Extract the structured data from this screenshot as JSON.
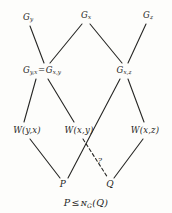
{
  "figure": {
    "kind": "subgroup-lattice-diagram",
    "caption": {
      "left": "P",
      "relation": "≤",
      "operator": "ɴ",
      "operator_subscript": "G",
      "argument": "(Q)",
      "full": "P ≤ 𝒩G(Q)"
    },
    "uncertain_marker": "?"
  },
  "nodes": {
    "top": [
      {
        "id": "G_y",
        "base": "G",
        "sub": "y",
        "x": 28,
        "y": 18
      },
      {
        "id": "G_x",
        "base": "G",
        "sub": "x",
        "x": 86,
        "y": 16
      },
      {
        "id": "G_z",
        "base": "G",
        "sub": "z",
        "x": 148,
        "y": 16
      }
    ],
    "middle": [
      {
        "id": "G_yx_eq_G_xy",
        "left_base": "G",
        "left_sub": "y,x",
        "equals": "=",
        "right_base": "G",
        "right_sub": "x,y",
        "x": 42,
        "y": 71
      },
      {
        "id": "G_xz",
        "base": "G",
        "sub": "x,z",
        "x": 124,
        "y": 71
      }
    ],
    "w_level": [
      {
        "id": "W_yx",
        "base": "W",
        "args": "(y,x)",
        "x": 27,
        "y": 130
      },
      {
        "id": "W_xy",
        "base": "W",
        "args": "(x,y)",
        "x": 79,
        "y": 130
      },
      {
        "id": "W_xz",
        "base": "W",
        "args": "(x,z)",
        "x": 145,
        "y": 130
      }
    ],
    "bottom": [
      {
        "id": "P",
        "label": "P",
        "x": 63,
        "y": 184
      },
      {
        "id": "Q",
        "label": "Q",
        "x": 110,
        "y": 184
      }
    ]
  },
  "marker": {
    "text": "?",
    "x": 100,
    "y": 160
  },
  "edges": [
    {
      "from": "G_y",
      "to": "G_yx_eq_G_xy",
      "style": "solid",
      "x1": 30,
      "y1": 26,
      "x2": 44,
      "y2": 63
    },
    {
      "from": "G_x",
      "to": "G_yx_eq_G_xy",
      "style": "solid",
      "x1": 82,
      "y1": 24,
      "x2": 50,
      "y2": 63
    },
    {
      "from": "G_x",
      "to": "G_xz",
      "style": "solid",
      "x1": 90,
      "y1": 24,
      "x2": 122,
      "y2": 63
    },
    {
      "from": "G_z",
      "to": "G_xz",
      "style": "solid",
      "x1": 146,
      "y1": 24,
      "x2": 128,
      "y2": 63
    },
    {
      "from": "G_yx_eq_G_xy",
      "to": "W_yx",
      "style": "solid",
      "x1": 36,
      "y1": 79,
      "x2": 24,
      "y2": 122
    },
    {
      "from": "G_yx_eq_G_xy",
      "to": "W_xy",
      "style": "solid",
      "x1": 48,
      "y1": 79,
      "x2": 74,
      "y2": 122
    },
    {
      "from": "G_xz",
      "to": "P_crossing",
      "style": "solid",
      "x1": 120,
      "y1": 79,
      "x2": 68,
      "y2": 178
    },
    {
      "from": "G_xz",
      "to": "W_xz",
      "style": "solid",
      "x1": 128,
      "y1": 79,
      "x2": 144,
      "y2": 122
    },
    {
      "from": "W_yx",
      "to": "P",
      "style": "solid",
      "x1": 30,
      "y1": 139,
      "x2": 60,
      "y2": 178
    },
    {
      "from": "W_xy",
      "to": "Q",
      "style": "dashed",
      "x1": 83,
      "y1": 139,
      "x2": 108,
      "y2": 178
    },
    {
      "from": "W_xz",
      "to": "Q",
      "style": "solid",
      "x1": 143,
      "y1": 139,
      "x2": 114,
      "y2": 178
    }
  ],
  "style": {
    "line_color": "#262624",
    "text_color": "#262624",
    "background": "#fdfdfb"
  }
}
